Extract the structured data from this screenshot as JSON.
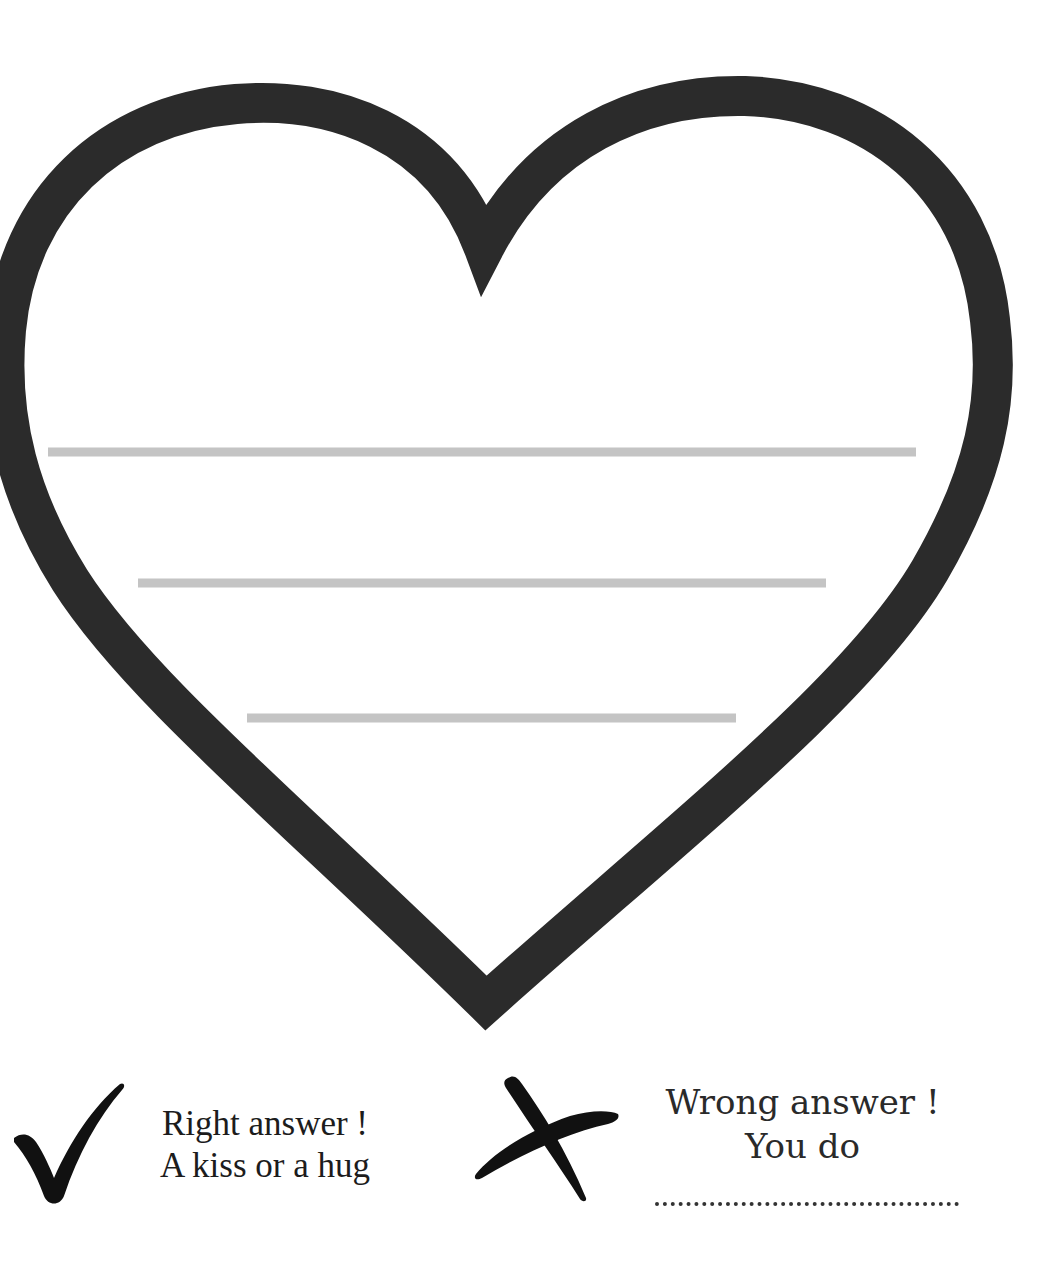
{
  "worksheet": {
    "heart": {
      "outline_color": "#2b2b2b",
      "writing_line_color": "#c4c4c4",
      "writing_lines": [
        {
          "x1": 48,
          "x2": 916,
          "y": 452
        },
        {
          "x1": 138,
          "x2": 826,
          "y": 583
        },
        {
          "x1": 247,
          "x2": 736,
          "y": 718
        }
      ]
    },
    "right_answer": {
      "icon": "check-icon",
      "line1": "Right answer !",
      "line2": "A kiss or a hug"
    },
    "wrong_answer": {
      "icon": "cross-icon",
      "line1": "Wrong answer !",
      "line2": "You do",
      "blank": ""
    }
  }
}
